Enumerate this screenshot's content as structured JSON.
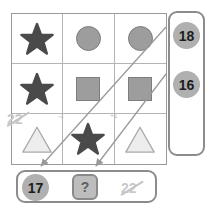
{
  "puzzle": {
    "grid": {
      "rows": 3,
      "cols": 3,
      "cells": [
        {
          "shape": "star-icon",
          "tone": "dark"
        },
        {
          "shape": "circle-icon",
          "tone": "medium"
        },
        {
          "shape": "circle-icon",
          "tone": "medium"
        },
        {
          "shape": "star-icon",
          "tone": "dark"
        },
        {
          "shape": "square-icon",
          "tone": "medium"
        },
        {
          "shape": "square-icon",
          "tone": "medium"
        },
        {
          "shape": "triangle-icon",
          "tone": "light"
        },
        {
          "shape": "star-icon",
          "tone": "dark"
        },
        {
          "shape": "triangle-icon",
          "tone": "light"
        }
      ]
    },
    "operators": {
      "minus_label": "-1",
      "plus_label": "+1"
    },
    "side_panel": {
      "options": [
        {
          "label": "18",
          "state": "available"
        },
        {
          "label": "16",
          "state": "available"
        }
      ],
      "struck_option": "22"
    },
    "answer_bar": {
      "filled_label": "17",
      "unknown_label": "?",
      "struck_option": "22"
    }
  },
  "colors": {
    "shape_dark": "#4a4a4a",
    "shape_medium": "#9d9d9d",
    "shape_light": "#ededed",
    "shape_outline": "#7d7d7d",
    "badge_fill": "#b0b0b0",
    "panel_border": "#8c8c8c",
    "grid_line": "#b4b4b4",
    "struck_text": "#c9c9c9",
    "arrow_stroke": "#9a9a9a"
  }
}
